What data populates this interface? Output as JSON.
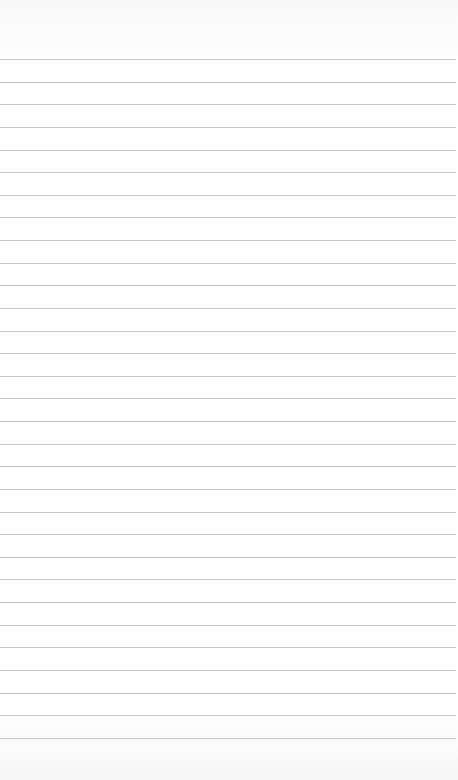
{
  "paper": {
    "type": "lined-paper",
    "line_count": 31,
    "first_line_y": 59,
    "line_spacing": 22.63,
    "line_color": "#c6c6c6",
    "background_color": "#fdfdfd"
  }
}
